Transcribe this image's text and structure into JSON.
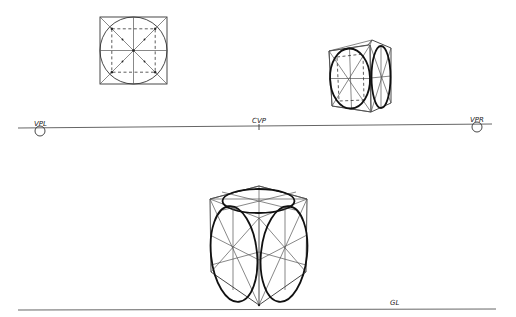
{
  "labels": {
    "vpl": "VPL",
    "cvp": "CVP",
    "vpr": "VPR",
    "gl": "GL"
  },
  "horizon_line": {
    "y_left": 128,
    "y_right": 124,
    "x_start": 18,
    "x_end": 492
  },
  "ground_line": {
    "y": 310,
    "x_start": 18,
    "x_end": 496
  },
  "figures": [
    {
      "name": "orthographic-square",
      "description": "Square with inscribed circle, diagonals, center cross and dashed inner square"
    },
    {
      "name": "small-perspective-cube",
      "description": "Cube above horizon with ellipses on two visible faces"
    },
    {
      "name": "large-perspective-cube",
      "description": "Cube below horizon with ellipses on top, left and right faces"
    }
  ],
  "colors": {
    "ink": "#111111",
    "construction": "#555555",
    "background": "#ffffff"
  }
}
